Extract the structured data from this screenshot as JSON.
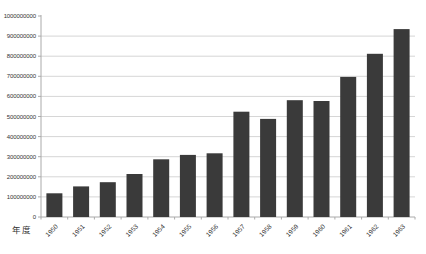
{
  "chart_data": {
    "type": "bar",
    "title": "",
    "xlabel": "年度",
    "ylabel": "",
    "categories": [
      "1950",
      "1951",
      "1952",
      "1953",
      "1954",
      "1955",
      "1956",
      "1957",
      "1958",
      "1959",
      "1960",
      "1961",
      "1962",
      "1963"
    ],
    "values": [
      118000000,
      152000000,
      173000000,
      214000000,
      287000000,
      309000000,
      317000000,
      524000000,
      488000000,
      581000000,
      577000000,
      697000000,
      812000000,
      935000000
    ],
    "ylim": [
      0,
      1000000000
    ],
    "ytick_step": 100000000,
    "ytick_labels": [
      "0",
      "100000000",
      "200000000",
      "300000000",
      "400000000",
      "500000000",
      "600000000",
      "700000000",
      "800000000",
      "900000000",
      "1000000000"
    ],
    "grid": true,
    "legend_position": "none",
    "bar_color": "#3a3a3a",
    "gridline_color": "#d6d6d6",
    "axis_color": "#aaaaaa",
    "label_color": "#333333"
  }
}
